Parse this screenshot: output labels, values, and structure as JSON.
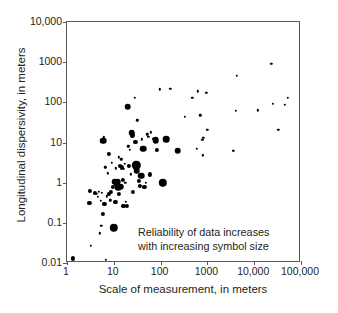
{
  "chart_data": {
    "type": "scatter",
    "title": "",
    "xlabel": "Scale of measurement, in meters",
    "ylabel": "Longitudinal dispersivity, in meters",
    "xscale": "log",
    "yscale": "log",
    "xlim": [
      1,
      100000
    ],
    "ylim": [
      0.01,
      10000
    ],
    "grid": false,
    "legend": null,
    "xticks": [
      "1",
      "10",
      "100",
      "1000",
      "10,000",
      "100,000"
    ],
    "xtick_values": [
      1,
      10,
      100,
      1000,
      10000,
      100000
    ],
    "yticks": [
      "0.01",
      "0.1",
      "1",
      "10",
      "100",
      "1000",
      "10,000"
    ],
    "ytick_values": [
      0.01,
      0.1,
      1,
      10,
      100,
      1000,
      10000
    ],
    "annotations": [
      {
        "name": "reliability-note",
        "line1": "Reliability of data increases",
        "line2": "with increasing symbol size"
      }
    ],
    "symbol_meaning": "Symbol size encodes data reliability; larger symbols indicate more reliable data.",
    "marker_color": "#000000",
    "size_classes": {
      "small": 2.4,
      "medium": 4.2,
      "large": 6.6,
      "xlarge": 8.4
    },
    "points": [
      {
        "x": 1.35,
        "y": 0.013,
        "size": "medium"
      },
      {
        "x": 3.0,
        "y": 0.31,
        "size": "medium"
      },
      {
        "x": 3.1,
        "y": 0.62,
        "size": "medium"
      },
      {
        "x": 3.2,
        "y": 0.027,
        "size": "small"
      },
      {
        "x": 4.0,
        "y": 0.55,
        "size": "medium"
      },
      {
        "x": 4.3,
        "y": 0.52,
        "size": "small"
      },
      {
        "x": 4.6,
        "y": 0.44,
        "size": "small"
      },
      {
        "x": 4.8,
        "y": 0.6,
        "size": "small"
      },
      {
        "x": 5.0,
        "y": 0.055,
        "size": "small"
      },
      {
        "x": 5.2,
        "y": 0.35,
        "size": "small"
      },
      {
        "x": 5.4,
        "y": 0.085,
        "size": "small"
      },
      {
        "x": 5.6,
        "y": 0.55,
        "size": "small"
      },
      {
        "x": 5.9,
        "y": 0.17,
        "size": "medium"
      },
      {
        "x": 6.0,
        "y": 11.0,
        "size": "large"
      },
      {
        "x": 6.1,
        "y": 13.5,
        "size": "small"
      },
      {
        "x": 6.3,
        "y": 0.3,
        "size": "medium"
      },
      {
        "x": 6.6,
        "y": 2.4,
        "size": "small"
      },
      {
        "x": 6.8,
        "y": 0.012,
        "size": "small"
      },
      {
        "x": 7.0,
        "y": 0.46,
        "size": "small"
      },
      {
        "x": 7.4,
        "y": 1.7,
        "size": "small"
      },
      {
        "x": 7.8,
        "y": 0.52,
        "size": "medium"
      },
      {
        "x": 8.0,
        "y": 5.2,
        "size": "medium"
      },
      {
        "x": 8.4,
        "y": 0.36,
        "size": "small"
      },
      {
        "x": 8.8,
        "y": 0.58,
        "size": "medium"
      },
      {
        "x": 9.2,
        "y": 3.1,
        "size": "small"
      },
      {
        "x": 9.6,
        "y": 0.8,
        "size": "medium"
      },
      {
        "x": 10.0,
        "y": 0.075,
        "size": "xlarge"
      },
      {
        "x": 10.4,
        "y": 1.05,
        "size": "large"
      },
      {
        "x": 10.8,
        "y": 0.33,
        "size": "medium"
      },
      {
        "x": 11.0,
        "y": 2.3,
        "size": "small"
      },
      {
        "x": 11.5,
        "y": 0.95,
        "size": "large"
      },
      {
        "x": 12.0,
        "y": 1.05,
        "size": "large"
      },
      {
        "x": 12.4,
        "y": 0.78,
        "size": "large"
      },
      {
        "x": 12.8,
        "y": 4.3,
        "size": "small"
      },
      {
        "x": 13.0,
        "y": 0.52,
        "size": "medium"
      },
      {
        "x": 13.5,
        "y": 2.6,
        "size": "medium"
      },
      {
        "x": 14.0,
        "y": 0.8,
        "size": "large"
      },
      {
        "x": 14.5,
        "y": 3.8,
        "size": "small"
      },
      {
        "x": 15.0,
        "y": 2.4,
        "size": "medium"
      },
      {
        "x": 15.5,
        "y": 1.15,
        "size": "medium"
      },
      {
        "x": 16.0,
        "y": 0.27,
        "size": "medium"
      },
      {
        "x": 16.5,
        "y": 2.2,
        "size": "small"
      },
      {
        "x": 17.0,
        "y": 2.9,
        "size": "small"
      },
      {
        "x": 17.5,
        "y": 1.0,
        "size": "small"
      },
      {
        "x": 18.0,
        "y": 0.33,
        "size": "small"
      },
      {
        "x": 19.0,
        "y": 0.26,
        "size": "medium"
      },
      {
        "x": 20.0,
        "y": 78.0,
        "size": "large"
      },
      {
        "x": 20.5,
        "y": 8.0,
        "size": "small"
      },
      {
        "x": 21.0,
        "y": 2.6,
        "size": "medium"
      },
      {
        "x": 22.0,
        "y": 6.5,
        "size": "small"
      },
      {
        "x": 23.0,
        "y": 1.6,
        "size": "small"
      },
      {
        "x": 24.0,
        "y": 17.5,
        "size": "large"
      },
      {
        "x": 25.0,
        "y": 15.0,
        "size": "medium"
      },
      {
        "x": 26.0,
        "y": 0.6,
        "size": "medium"
      },
      {
        "x": 28.0,
        "y": 130.0,
        "size": "small"
      },
      {
        "x": 29.0,
        "y": 10.5,
        "size": "medium"
      },
      {
        "x": 30.0,
        "y": 2.7,
        "size": "xlarge"
      },
      {
        "x": 31.0,
        "y": 2.0,
        "size": "large"
      },
      {
        "x": 32.0,
        "y": 36.0,
        "size": "small"
      },
      {
        "x": 34.0,
        "y": 1.1,
        "size": "medium"
      },
      {
        "x": 36.0,
        "y": 0.85,
        "size": "medium"
      },
      {
        "x": 38.0,
        "y": 1.5,
        "size": "large"
      },
      {
        "x": 40.0,
        "y": 12.0,
        "size": "small"
      },
      {
        "x": 42.0,
        "y": 7.0,
        "size": "large"
      },
      {
        "x": 45.0,
        "y": 0.8,
        "size": "medium"
      },
      {
        "x": 48.0,
        "y": 1.0,
        "size": "small"
      },
      {
        "x": 52.0,
        "y": 16.0,
        "size": "small"
      },
      {
        "x": 55.0,
        "y": 14.0,
        "size": "small"
      },
      {
        "x": 58.0,
        "y": 1.6,
        "size": "medium"
      },
      {
        "x": 62.0,
        "y": 18.0,
        "size": "small"
      },
      {
        "x": 70.0,
        "y": 12.5,
        "size": "small"
      },
      {
        "x": 78.0,
        "y": 11.5,
        "size": "large"
      },
      {
        "x": 85.0,
        "y": 6.5,
        "size": "medium"
      },
      {
        "x": 95.0,
        "y": 210.0,
        "size": "small"
      },
      {
        "x": 110.0,
        "y": 1.0,
        "size": "xlarge"
      },
      {
        "x": 130.0,
        "y": 12.0,
        "size": "large"
      },
      {
        "x": 160.0,
        "y": 220.0,
        "size": "small"
      },
      {
        "x": 230.0,
        "y": 6.2,
        "size": "large"
      },
      {
        "x": 330.0,
        "y": 44.0,
        "size": "small"
      },
      {
        "x": 480.0,
        "y": 130.0,
        "size": "small"
      },
      {
        "x": 600.0,
        "y": 7.0,
        "size": "small"
      },
      {
        "x": 620.0,
        "y": 190.0,
        "size": "small"
      },
      {
        "x": 700.0,
        "y": 48.0,
        "size": "small"
      },
      {
        "x": 780.0,
        "y": 11.5,
        "size": "small"
      },
      {
        "x": 800.0,
        "y": 4.8,
        "size": "small"
      },
      {
        "x": 820.0,
        "y": 13.0,
        "size": "small"
      },
      {
        "x": 950.0,
        "y": 175.0,
        "size": "small"
      },
      {
        "x": 1000.0,
        "y": 21.0,
        "size": "small"
      },
      {
        "x": 3600.0,
        "y": 6.2,
        "size": "small"
      },
      {
        "x": 4000.0,
        "y": 62.0,
        "size": "small"
      },
      {
        "x": 4300.0,
        "y": 460.0,
        "size": "small"
      },
      {
        "x": 12000.0,
        "y": 63.0,
        "size": "small"
      },
      {
        "x": 23000.0,
        "y": 900.0,
        "size": "small"
      },
      {
        "x": 25000.0,
        "y": 92.0,
        "size": "small"
      },
      {
        "x": 33000.0,
        "y": 21.0,
        "size": "small"
      },
      {
        "x": 45000.0,
        "y": 88.0,
        "size": "small"
      },
      {
        "x": 52000.0,
        "y": 130.0,
        "size": "small"
      }
    ]
  }
}
